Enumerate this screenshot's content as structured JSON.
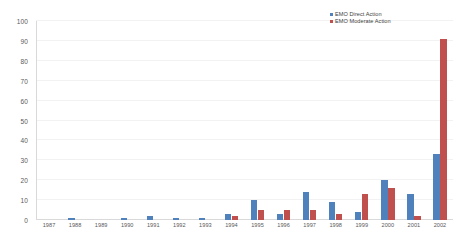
{
  "chart_data": {
    "type": "bar",
    "title": "",
    "subtitle": "",
    "xlabel": "",
    "ylabel": "",
    "ylim": [
      0,
      100
    ],
    "ytick_step": 10,
    "yticks": [
      0,
      10,
      20,
      30,
      40,
      50,
      60,
      70,
      80,
      90,
      100
    ],
    "grid": true,
    "legend_position": "top-right",
    "categories": [
      "1987",
      "1988",
      "1989",
      "1990",
      "1991",
      "1992",
      "1993",
      "1994",
      "1995",
      "1996",
      "1997",
      "1998",
      "1999",
      "2000",
      "2001",
      "2002"
    ],
    "series": [
      {
        "name": "EMO  Direct Action",
        "color": "#4F81BD",
        "values": [
          0,
          1,
          0,
          1,
          2,
          1,
          1,
          3,
          10,
          3,
          14,
          9,
          4,
          20,
          13,
          33
        ]
      },
      {
        "name": "EMO  Moderate Action",
        "color": "#C0504D",
        "values": [
          0,
          0,
          0,
          0,
          0,
          0,
          0,
          2,
          5,
          5,
          5,
          3,
          13,
          16,
          2,
          91
        ]
      }
    ]
  },
  "legend": {
    "items": [
      {
        "label": "EMO  Direct Action",
        "color": "#4F81BD"
      },
      {
        "label": "EMO  Moderate Action",
        "color": "#C0504D"
      }
    ]
  },
  "colors": {
    "direct_action": "#4F81BD",
    "moderate_action": "#C0504D",
    "gridline": "#F2F2F2",
    "axis": "#D9D9D9",
    "tick_text": "#595959",
    "background": "#FFFFFF"
  }
}
